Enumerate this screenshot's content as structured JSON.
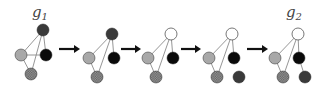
{
  "labels": [
    {
      "id": "g1",
      "base": "g",
      "sub": "1",
      "x": 32,
      "y": 17
    },
    {
      "id": "g2",
      "base": "g",
      "sub": "2",
      "x": 286,
      "y": 17
    }
  ],
  "colors": {
    "dark": "#3a3a3a",
    "black": "#0a0a0a",
    "light": "#a8a8a8",
    "white": "#ffffff",
    "checkered_a": "#6e6e6e",
    "checkered_b": "#9a9a9a",
    "edge": "#8a8a8a",
    "arrow": "#111111"
  },
  "node_radius": 6,
  "graphs": [
    {
      "name": "graph-1-g1",
      "nodes": [
        {
          "id": "top",
          "x": 43,
          "y": 30,
          "fill": "dark"
        },
        {
          "id": "left",
          "x": 21,
          "y": 55,
          "fill": "light"
        },
        {
          "id": "right",
          "x": 46,
          "y": 55,
          "fill": "black"
        },
        {
          "id": "bottom",
          "x": 31,
          "y": 74,
          "fill": "checkered"
        }
      ],
      "edges": [
        [
          "top",
          "left"
        ],
        [
          "top",
          "right"
        ],
        [
          "top",
          "bottom"
        ],
        [
          "left",
          "right"
        ],
        [
          "left",
          "bottom"
        ]
      ]
    },
    {
      "name": "graph-2",
      "nodes": [
        {
          "id": "top",
          "x": 112,
          "y": 34,
          "fill": "dark"
        },
        {
          "id": "left",
          "x": 89,
          "y": 58,
          "fill": "light"
        },
        {
          "id": "right",
          "x": 114,
          "y": 58,
          "fill": "black"
        },
        {
          "id": "bottom",
          "x": 97,
          "y": 77,
          "fill": "checkered"
        }
      ],
      "edges": [
        [
          "top",
          "left"
        ],
        [
          "top",
          "right"
        ],
        [
          "top",
          "bottom"
        ],
        [
          "left",
          "bottom"
        ]
      ]
    },
    {
      "name": "graph-3",
      "nodes": [
        {
          "id": "top",
          "x": 171,
          "y": 34,
          "fill": "white"
        },
        {
          "id": "left",
          "x": 148,
          "y": 58,
          "fill": "light"
        },
        {
          "id": "right",
          "x": 173,
          "y": 58,
          "fill": "black"
        },
        {
          "id": "bottom",
          "x": 156,
          "y": 77,
          "fill": "checkered"
        }
      ],
      "edges": [
        [
          "top",
          "left"
        ],
        [
          "top",
          "right"
        ],
        [
          "top",
          "bottom"
        ],
        [
          "left",
          "bottom"
        ]
      ]
    },
    {
      "name": "graph-4",
      "nodes": [
        {
          "id": "top",
          "x": 232,
          "y": 34,
          "fill": "white"
        },
        {
          "id": "left",
          "x": 209,
          "y": 58,
          "fill": "light"
        },
        {
          "id": "right",
          "x": 234,
          "y": 58,
          "fill": "black"
        },
        {
          "id": "bottom",
          "x": 217,
          "y": 77,
          "fill": "checkered"
        },
        {
          "id": "extra",
          "x": 239,
          "y": 77,
          "fill": "dark"
        }
      ],
      "edges": [
        [
          "top",
          "left"
        ],
        [
          "top",
          "right"
        ],
        [
          "top",
          "bottom"
        ],
        [
          "left",
          "bottom"
        ]
      ]
    },
    {
      "name": "graph-5-g2",
      "nodes": [
        {
          "id": "top",
          "x": 298,
          "y": 34,
          "fill": "white"
        },
        {
          "id": "left",
          "x": 275,
          "y": 58,
          "fill": "light"
        },
        {
          "id": "right",
          "x": 299,
          "y": 58,
          "fill": "black"
        },
        {
          "id": "bottom",
          "x": 283,
          "y": 77,
          "fill": "checkered"
        },
        {
          "id": "extra",
          "x": 305,
          "y": 77,
          "fill": "dark"
        }
      ],
      "edges": [
        [
          "top",
          "left"
        ],
        [
          "top",
          "right"
        ],
        [
          "top",
          "bottom"
        ],
        [
          "left",
          "bottom"
        ],
        [
          "right",
          "extra"
        ]
      ]
    }
  ],
  "arrows": [
    {
      "x1": 59,
      "x2": 80,
      "y": 49
    },
    {
      "x1": 121,
      "x2": 141,
      "y": 49
    },
    {
      "x1": 181,
      "x2": 201,
      "y": 49
    },
    {
      "x1": 247,
      "x2": 268,
      "y": 49
    }
  ]
}
